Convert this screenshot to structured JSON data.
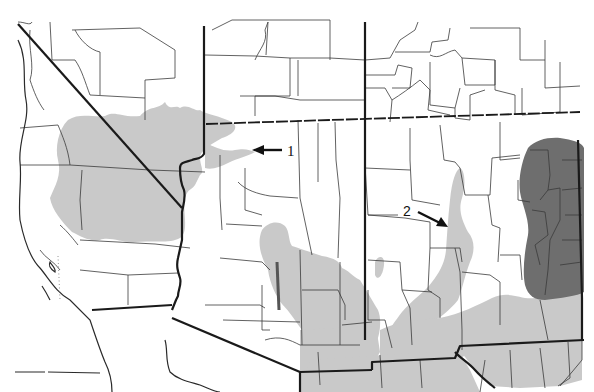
{
  "map": {
    "type": "distribution-range-map",
    "region": "Southwestern United States",
    "states_depicted": [
      "California",
      "Nevada",
      "Utah",
      "Colorado",
      "Arizona",
      "New Mexico",
      "Texas"
    ],
    "legend": {
      "light_shading": {
        "color": "#c9c9c9",
        "meaning": "range (light shading)"
      },
      "dark_shading": {
        "color": "#6e6e6e",
        "meaning": "range (dark shading)"
      }
    },
    "annotations": [
      {
        "id": "1",
        "label": "1",
        "arrow_direction": "left",
        "x": 262,
        "y": 150
      },
      {
        "id": "2",
        "label": "2",
        "arrow_direction": "down-right",
        "x": 408,
        "y": 210
      }
    ]
  }
}
